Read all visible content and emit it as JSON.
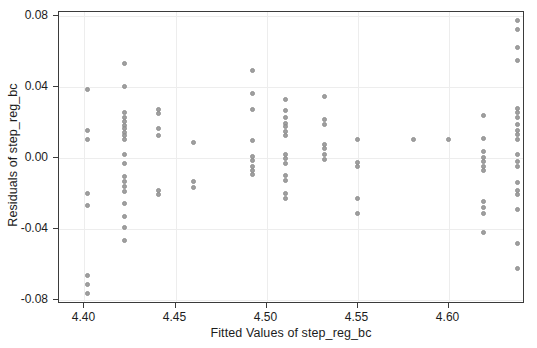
{
  "chart_data": {
    "type": "scatter",
    "title": "",
    "xlabel": "Fitted Values of step_reg_bc",
    "ylabel": "Residuals of step_reg_bc",
    "xlim": [
      4.386,
      4.642
    ],
    "ylim": [
      -0.082,
      0.082
    ],
    "xticks": [
      4.4,
      4.45,
      4.5,
      4.55,
      4.6
    ],
    "xticklabels": [
      "4.40",
      "4.45",
      "4.50",
      "4.55",
      "4.60"
    ],
    "yticks": [
      0.08,
      0.04,
      0.0,
      -0.04,
      -0.08
    ],
    "yticklabels": [
      "0.08",
      "0.04",
      "0.00",
      "-0.04",
      "-0.08"
    ],
    "grid": true,
    "legend": null,
    "marker": {
      "shape": "circle",
      "color": "#9a9a9a",
      "edge_color": "#8d8d8d",
      "size": 5
    },
    "points": [
      [
        4.4015,
        0.0385
      ],
      [
        4.4015,
        0.0155
      ],
      [
        4.4015,
        0.0105
      ],
      [
        4.4015,
        -0.02
      ],
      [
        4.4015,
        -0.0265
      ],
      [
        4.4015,
        -0.066
      ],
      [
        4.4015,
        -0.071
      ],
      [
        4.4015,
        -0.076
      ],
      [
        4.422,
        0.053
      ],
      [
        4.422,
        0.04
      ],
      [
        4.422,
        0.0255
      ],
      [
        4.422,
        0.0225
      ],
      [
        4.422,
        0.0205
      ],
      [
        4.422,
        0.0185
      ],
      [
        4.422,
        0.0165
      ],
      [
        4.422,
        0.0145
      ],
      [
        4.422,
        0.0125
      ],
      [
        4.422,
        0.0105
      ],
      [
        4.422,
        0.002
      ],
      [
        4.422,
        -0.003
      ],
      [
        4.422,
        -0.0105
      ],
      [
        4.422,
        -0.013
      ],
      [
        4.422,
        -0.016
      ],
      [
        4.422,
        -0.019
      ],
      [
        4.422,
        -0.0255
      ],
      [
        4.422,
        -0.033
      ],
      [
        4.422,
        -0.039
      ],
      [
        4.422,
        -0.0465
      ],
      [
        4.4405,
        0.027
      ],
      [
        4.4405,
        0.025
      ],
      [
        4.4405,
        0.0165
      ],
      [
        4.4405,
        0.0125
      ],
      [
        4.4405,
        -0.0185
      ],
      [
        4.4405,
        -0.0205
      ],
      [
        4.46,
        0.0085
      ],
      [
        4.46,
        -0.013
      ],
      [
        4.46,
        -0.0165
      ],
      [
        4.4925,
        0.049
      ],
      [
        4.4925,
        0.0365
      ],
      [
        4.4925,
        0.027
      ],
      [
        4.4925,
        0.01
      ],
      [
        4.4925,
        0.001
      ],
      [
        4.4925,
        -0.0015
      ],
      [
        4.4925,
        -0.0045
      ],
      [
        4.4925,
        -0.007
      ],
      [
        4.4925,
        -0.0095
      ],
      [
        4.5105,
        0.033
      ],
      [
        4.5105,
        0.0265
      ],
      [
        4.5105,
        0.023
      ],
      [
        4.5105,
        0.0195
      ],
      [
        4.5105,
        0.0175
      ],
      [
        4.5105,
        0.015
      ],
      [
        4.5105,
        0.0125
      ],
      [
        4.5105,
        0.002
      ],
      [
        4.5105,
        -0.0005
      ],
      [
        4.5105,
        -0.003
      ],
      [
        4.5105,
        -0.01
      ],
      [
        4.5105,
        -0.0125
      ],
      [
        4.5105,
        -0.02
      ],
      [
        4.5105,
        -0.0225
      ],
      [
        4.532,
        0.0345
      ],
      [
        4.532,
        0.0215
      ],
      [
        4.532,
        0.019
      ],
      [
        4.532,
        0.0075
      ],
      [
        4.532,
        0.0055
      ],
      [
        4.532,
        0.002
      ],
      [
        4.532,
        -0.001
      ],
      [
        4.55,
        0.0105
      ],
      [
        4.55,
        -0.0025
      ],
      [
        4.55,
        -0.005
      ],
      [
        4.55,
        -0.0225
      ],
      [
        4.55,
        -0.031
      ],
      [
        4.5805,
        0.0105
      ],
      [
        4.6,
        0.0105
      ],
      [
        4.619,
        0.024
      ],
      [
        4.619,
        0.011
      ],
      [
        4.619,
        0.0035
      ],
      [
        4.619,
        0.0005
      ],
      [
        4.619,
        -0.002
      ],
      [
        4.619,
        -0.0045
      ],
      [
        4.619,
        -0.007
      ],
      [
        4.619,
        -0.0245
      ],
      [
        4.619,
        -0.028
      ],
      [
        4.619,
        -0.031
      ],
      [
        4.619,
        -0.042
      ],
      [
        4.638,
        0.077
      ],
      [
        4.638,
        0.072
      ],
      [
        4.638,
        0.062
      ],
      [
        4.638,
        0.0545
      ],
      [
        4.638,
        0.028
      ],
      [
        4.638,
        0.0255
      ],
      [
        4.638,
        0.0225
      ],
      [
        4.638,
        0.019
      ],
      [
        4.638,
        0.0155
      ],
      [
        4.638,
        0.013
      ],
      [
        4.638,
        0.0105
      ],
      [
        4.638,
        0.002
      ],
      [
        4.638,
        -0.002
      ],
      [
        4.638,
        -0.0045
      ],
      [
        4.638,
        -0.0135
      ],
      [
        4.638,
        -0.018
      ],
      [
        4.638,
        -0.0205
      ],
      [
        4.638,
        -0.029
      ],
      [
        4.638,
        -0.048
      ],
      [
        4.638,
        -0.062
      ]
    ]
  }
}
